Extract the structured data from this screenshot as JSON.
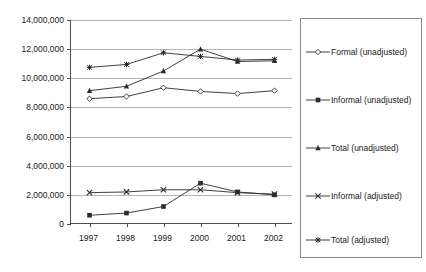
{
  "chart_data": {
    "type": "line",
    "title": "",
    "xlabel": "",
    "ylabel": "",
    "categories": [
      "1997",
      "1998",
      "1999",
      "2000",
      "2001",
      "2002"
    ],
    "ylim": [
      0,
      14000000
    ],
    "ytick_values": [
      0,
      2000000,
      4000000,
      6000000,
      8000000,
      10000000,
      12000000,
      14000000
    ],
    "ytick_labels": [
      "0",
      "2,000,000",
      "4,000,000",
      "6,000,000",
      "8,000,000",
      "10,000,000",
      "12,000,000",
      "14,000,000"
    ],
    "grid": true,
    "legend_position": "right",
    "series": [
      {
        "name": "Formal (unadjusted)",
        "marker": "diamond-hollow",
        "color": "#2b2b2b",
        "values": [
          8600000,
          8750000,
          9350000,
          9100000,
          8950000,
          9150000
        ]
      },
      {
        "name": "Informal (unadjusted)",
        "marker": "square-filled",
        "color": "#2b2b2b",
        "values": [
          600000,
          750000,
          1200000,
          2800000,
          2200000,
          2000000
        ]
      },
      {
        "name": "Total (unadjusted)",
        "marker": "triangle-filled",
        "color": "#2b2b2b",
        "values": [
          9150000,
          9450000,
          10500000,
          12000000,
          11150000,
          11200000
        ]
      },
      {
        "name": "Informal (adjusted)",
        "marker": "cross-x",
        "color": "#2b2b2b",
        "values": [
          2150000,
          2200000,
          2350000,
          2350000,
          2150000,
          2050000
        ]
      },
      {
        "name": "Total (adjusted)",
        "marker": "asterisk-star",
        "color": "#2b2b2b",
        "values": [
          10750000,
          10950000,
          11750000,
          11500000,
          11250000,
          11300000
        ]
      }
    ]
  },
  "legend": {
    "items": [
      {
        "label": "Formal (unadjusted)",
        "marker": "diamond-hollow"
      },
      {
        "label": "Informal (unadjusted)",
        "marker": "square-filled"
      },
      {
        "label": "Total (unadjusted)",
        "marker": "triangle-filled"
      },
      {
        "label": "Informal (adjusted)",
        "marker": "cross-x"
      },
      {
        "label": "Total (adjusted)",
        "marker": "asterisk-star"
      }
    ]
  }
}
